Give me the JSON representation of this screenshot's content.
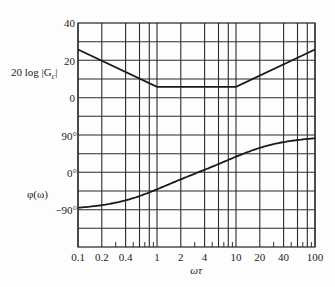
{
  "chart_data": {
    "type": "line",
    "title": "",
    "xlabel": "ωτ",
    "xscale": "log",
    "xlim": [
      0.1,
      100
    ],
    "x_tick_labels": [
      "0.1",
      "0.2",
      "0.4",
      "1",
      "2",
      "4",
      "10",
      "20",
      "40",
      "100"
    ],
    "x_grid_lines": [
      0.1,
      0.2,
      0.4,
      0.6,
      0.8,
      1,
      2,
      4,
      6,
      8,
      10,
      20,
      40,
      60,
      80,
      100
    ],
    "x_minor_ticks": [
      0.3,
      0.5,
      0.7,
      0.9,
      3,
      5,
      7,
      9,
      30,
      50,
      70,
      90
    ],
    "grid": true,
    "panels": [
      {
        "name": "magnitude",
        "ylabel": "20 log |Gc|",
        "ylabel_main": "20 log |G",
        "ylabel_sub": "c",
        "ylabel_close": "|",
        "y_tick_labels": [
          {
            "value": 40,
            "label": "40"
          },
          {
            "value": 20,
            "label": "20"
          },
          {
            "value": 0,
            "label": "0"
          }
        ],
        "unit": "dB",
        "series": [
          {
            "name": "20 log |Gc| (asymptotic)",
            "x": [
              0.1,
              1,
              10,
              100
            ],
            "y": [
              26,
              6,
              6,
              26
            ]
          }
        ]
      },
      {
        "name": "phase",
        "ylabel": "φ(ω)",
        "y_tick_labels": [
          {
            "value": 90,
            "label": "90°"
          },
          {
            "value": 0,
            "label": "0°"
          },
          {
            "value": -90,
            "label": "−90°"
          }
        ],
        "unit": "deg",
        "series": [
          {
            "name": "φ(ω)",
            "x": [
              0.1,
              0.2,
              0.4,
              0.6,
              1,
              2,
              3.16,
              4,
              6,
              10,
              20,
              40,
              60,
              100
            ],
            "y": [
              -84,
              -78,
              -68,
              -60,
              -45,
              -25,
              0,
              10,
              25,
              42,
              62,
              75,
              79,
              84
            ]
          }
        ]
      }
    ]
  },
  "labels": {
    "xlabel": "ωτ",
    "mag_ylabel_main": "20 log |G",
    "mag_ylabel_sub": "c",
    "mag_ylabel_close": "|",
    "phase_ylabel": "φ(ω)"
  }
}
